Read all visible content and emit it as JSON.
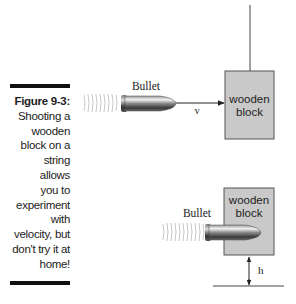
{
  "caption": {
    "figure_label": "Figure 9-3:",
    "text_lines": [
      "Shooting a",
      "wooden",
      "block on a",
      "string",
      "allows",
      "you to",
      "experiment",
      "with",
      "velocity, but",
      "don't try it at",
      "home!"
    ]
  },
  "diagram_top": {
    "bullet_label": "Bullet",
    "velocity_label": "v",
    "block_label_line1": "wooden",
    "block_label_line2": "block"
  },
  "diagram_bottom": {
    "bullet_label": "Bullet",
    "block_label_line1": "wooden",
    "block_label_line2": "block",
    "height_label": "h"
  },
  "colors": {
    "block_fill": "#c9c9c9",
    "block_stroke": "#555555",
    "rule": "#111111"
  }
}
